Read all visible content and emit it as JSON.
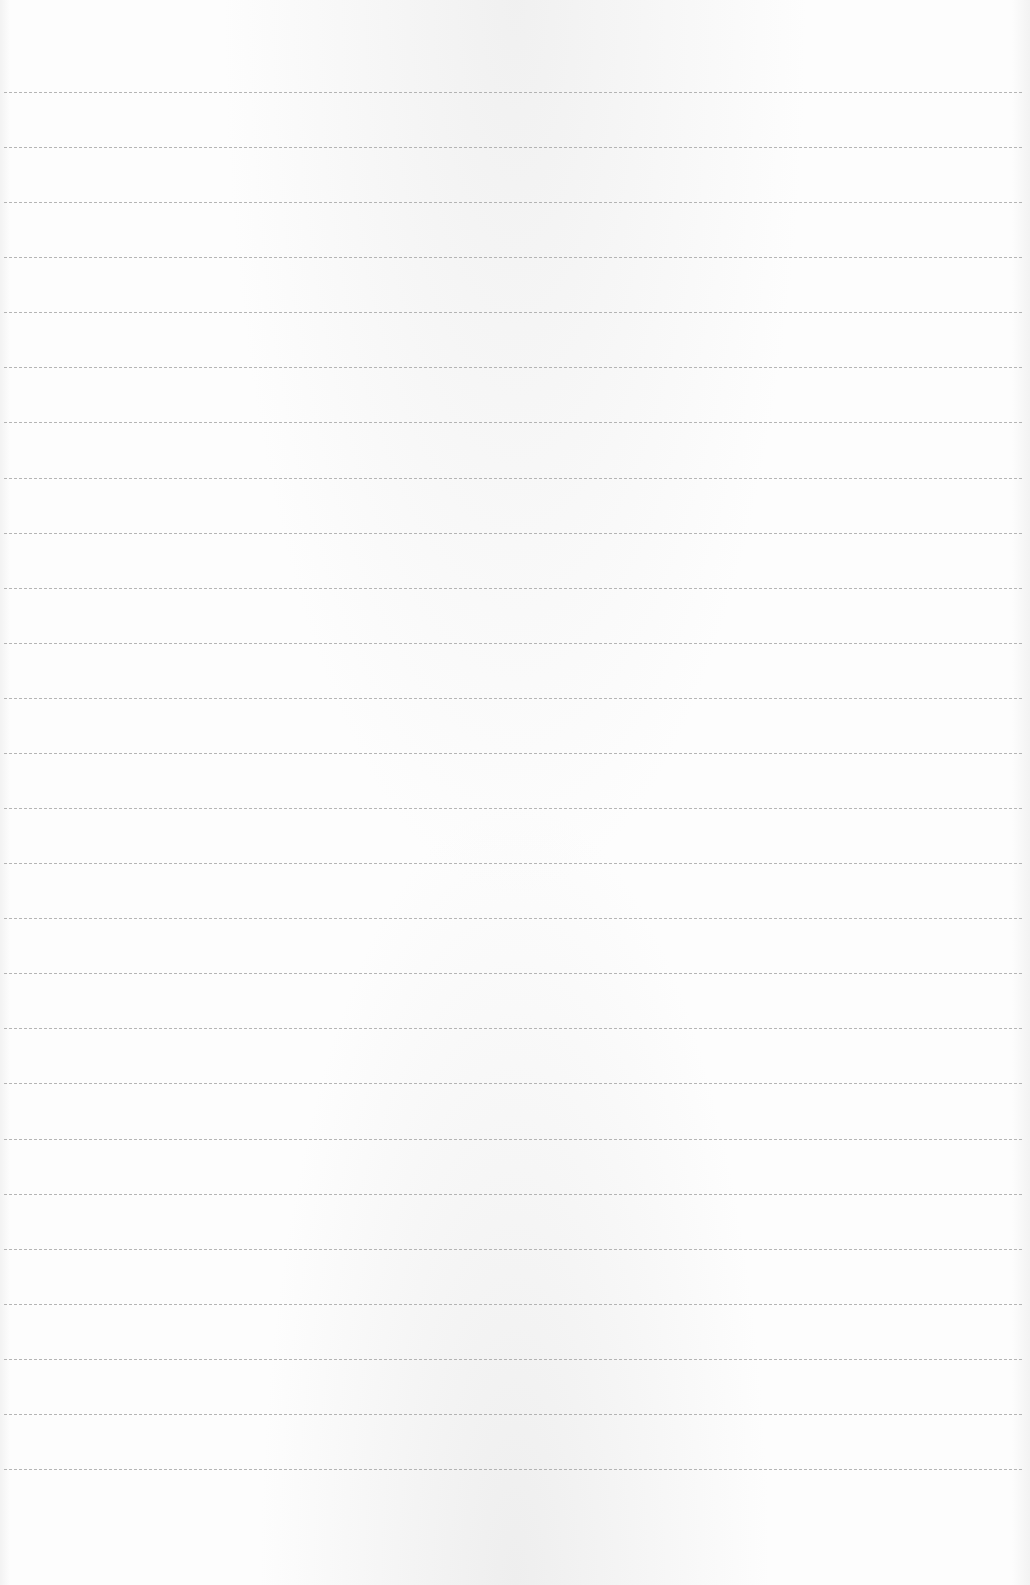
{
  "page": {
    "type": "lined-paper",
    "background_color": "#fdfdfd",
    "line_color": "#a9a9a9",
    "line_count": 26,
    "first_line_y": 92,
    "line_spacing_px": 55.08,
    "line_left_x": 4,
    "line_right_x": 1022,
    "content": []
  }
}
